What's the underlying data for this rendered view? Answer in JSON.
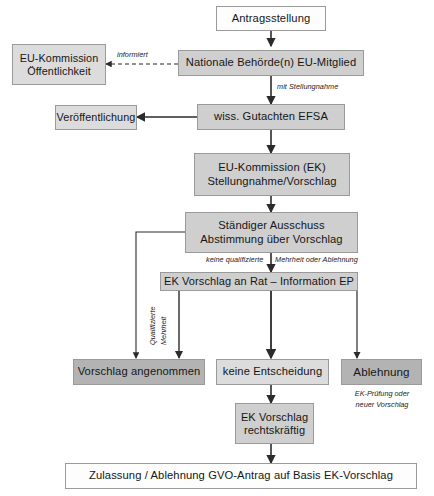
{
  "diagram": {
    "language": "de",
    "palette": {
      "box_border": "#9a9a9a",
      "fill_white": "#fdfdfd",
      "fill_light": "#dcdcdc",
      "fill_mid": "#cfcfcf",
      "fill_dark": "#b3b3b3",
      "line": "#2b2b2b",
      "text": "#161616"
    },
    "nodes": [
      {
        "id": "antragsstellung",
        "label": "Antragsstellung"
      },
      {
        "id": "eu-kommission-oeffentlichkeit",
        "line1": "EU-Kommission",
        "line2": "Öffentlichkeit"
      },
      {
        "id": "nationale-behoerde",
        "label": "Nationale Behörde(n) EU-Mitglied"
      },
      {
        "id": "veroeffentlichung",
        "label": "Veröffentlichung"
      },
      {
        "id": "wiss-gutachten-efsa",
        "label": "wiss. Gutachten EFSA"
      },
      {
        "id": "eu-kommission-ek",
        "line1": "EU-Kommission (EK)",
        "line2": "Stellungnahme/Vorschlag"
      },
      {
        "id": "staendiger-ausschuss",
        "line1": "Ständiger Ausschuss",
        "line2": "Abstimmung über Vorschlag"
      },
      {
        "id": "ek-vorschlag-rat",
        "label": "EK Vorschlag an Rat – Information EP"
      },
      {
        "id": "vorschlag-angenommen",
        "label": "Vorschlag angenommen"
      },
      {
        "id": "keine-entscheidung",
        "label": "keine Entscheidung"
      },
      {
        "id": "ablehnung",
        "label": "Ablehnung"
      },
      {
        "id": "ek-vorschlag-rechtskraeftig",
        "line1": "EK Vorschlag",
        "line2": "rechtskräftig"
      },
      {
        "id": "zulassung-ablehnung",
        "label": "Zulassung / Ablehnung GVO-Antrag auf Basis EK-Vorschlag"
      }
    ],
    "edge_labels": {
      "informiert": "informiert",
      "mit_stellungnahme": "mit Stellungnahme",
      "keine_qualifizierte": "keine qualifizierte",
      "mehrheit_oder_ablehnung": "Mehrheit  oder Ablehnung",
      "qualifizierte": "Qualifizierte",
      "mehrheit": "Mehrheit"
    },
    "notes": {
      "ablehnung_note_line1": "EK-Prüfung oder",
      "ablehnung_note_line2": "neuer Vorschlag"
    }
  }
}
